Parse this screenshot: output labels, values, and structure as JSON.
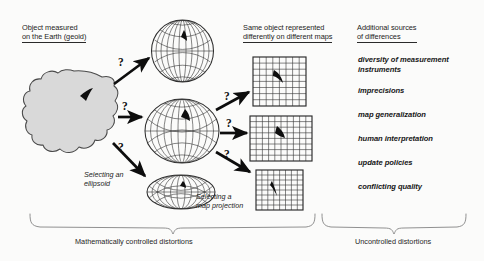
{
  "diagram": {
    "headers": {
      "geoid": "Object measured\non the Earth (geoid)",
      "maps": "Same object represented\ndifferently on different maps",
      "sources": "Additional sources\nof differences"
    },
    "step_labels": {
      "ellipsoid": "Selecting an\nellipsoid",
      "projection": "Selecting a\nmap projection"
    },
    "question_marks": [
      {
        "id": "q-geoid-top",
        "text": "?"
      },
      {
        "id": "q-geoid-mid",
        "text": "?"
      },
      {
        "id": "q-geoid-bottom",
        "text": "?"
      },
      {
        "id": "q-map-top",
        "text": "?"
      },
      {
        "id": "q-map-mid",
        "text": "?"
      },
      {
        "id": "q-map-bottom",
        "text": "?"
      }
    ],
    "sources_list": [
      "diversity of measurement\ninstruments",
      "imprecisions",
      "map generalization",
      "human interpretation",
      "update policies",
      "conflicting quality"
    ],
    "captions": {
      "left": "Mathematically controlled distortions",
      "right": "Uncontrolled distortions"
    },
    "colors": {
      "background": "#fbfbfa",
      "ink": "#1b1b1b",
      "geoid_fill": "#d9d9d9",
      "geoid_stroke": "#4a4a4a",
      "grid_stroke": "#3a3a3a",
      "arrow": "#0d0d0d",
      "brace": "#777777"
    }
  }
}
